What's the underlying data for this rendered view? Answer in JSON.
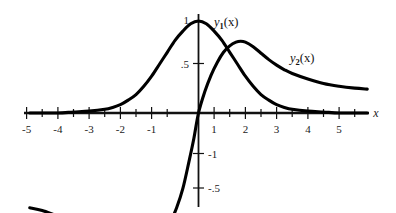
{
  "figure": {
    "background_color": "#ffffff",
    "curve_color": "#000000",
    "axis_color": "#111111"
  },
  "axes": {
    "x_axis_name": "x",
    "x_label_prefix": "y",
    "x_ticks_major": [
      -5,
      -4,
      -3,
      -2,
      -1,
      1,
      2,
      3,
      4,
      5
    ],
    "x_tick_labels": [
      "-5",
      "-4",
      "-3",
      "-2",
      "-1",
      "1",
      "2",
      "3",
      "4",
      "5"
    ],
    "x_ticks_minor_step": 0.5,
    "x_range": [
      -5.45,
      5.45
    ],
    "y_range": [
      -1.62,
      1.18
    ],
    "y_tick_values": [
      1,
      0.5,
      -1,
      -1.5
    ],
    "y_tick_labels": [
      "1",
      ".5",
      "-1",
      "-.5"
    ],
    "grid": false
  },
  "labels": {
    "y1": {
      "base": "y",
      "sub": "1",
      "arg": "(x)"
    },
    "y2": {
      "base": "y",
      "sub": "2",
      "arg": "(x)"
    }
  },
  "chart_data": {
    "type": "line",
    "xlabel": "x",
    "ylabel": "",
    "xlim": [
      -5.45,
      5.45
    ],
    "ylim": [
      -1.62,
      1.18
    ],
    "grid": false,
    "legend_position": "inline-annotation",
    "x_ticks": [
      -5,
      -4,
      -3,
      -2,
      -1,
      0,
      1,
      2,
      3,
      4,
      5
    ],
    "y_ticks": [
      1,
      0.5,
      -1,
      -1.5
    ],
    "y_tick_labels": [
      "1",
      ".5",
      "-1",
      "-.5"
    ],
    "series": [
      {
        "name": "y1(x)",
        "description": "Bell-shaped curve peaking at x=0 with maximum value 1, decaying to 0 on both sides",
        "x": [
          -5.4,
          -5.0,
          -4.5,
          -4.0,
          -3.5,
          -3.0,
          -2.75,
          -2.5,
          -2.25,
          -2.0,
          -1.75,
          -1.5,
          -1.25,
          -1.0,
          -0.75,
          -0.5,
          -0.25,
          0.0,
          0.25,
          0.5,
          0.75,
          1.0,
          1.25,
          1.5,
          1.75,
          2.0,
          2.25,
          2.5,
          2.75,
          3.0,
          3.5,
          4.0,
          4.5,
          5.0,
          5.4
        ],
        "y": [
          0.0,
          0.0,
          0.0,
          0.01,
          0.02,
          0.04,
          0.06,
          0.09,
          0.14,
          0.2,
          0.29,
          0.4,
          0.53,
          0.66,
          0.79,
          0.89,
          0.97,
          1.0,
          0.97,
          0.89,
          0.79,
          0.66,
          0.53,
          0.4,
          0.29,
          0.2,
          0.14,
          0.09,
          0.06,
          0.04,
          0.02,
          0.01,
          0.0,
          0.0,
          0.0
        ]
      },
      {
        "name": "y2(x)",
        "description": "Odd-like curve through origin, minimum about -1.33 near x=-1.3, maximum about 0.78 near x=1.35, long positive tail at right and flat negative tail at left",
        "x": [
          -5.4,
          -5.0,
          -4.5,
          -4.0,
          -3.5,
          -3.0,
          -2.5,
          -2.0,
          -1.75,
          -1.5,
          -1.3,
          -1.1,
          -0.9,
          -0.7,
          -0.5,
          -0.3,
          -0.15,
          0.0,
          0.2,
          0.4,
          0.6,
          0.8,
          1.0,
          1.2,
          1.35,
          1.5,
          1.75,
          2.0,
          2.25,
          2.5,
          2.75,
          3.0,
          3.5,
          4.0,
          4.5,
          5.0,
          5.4
        ],
        "y": [
          -1.03,
          -1.06,
          -1.12,
          -1.17,
          -1.22,
          -1.27,
          -1.32,
          -1.33,
          -1.33,
          -1.33,
          -1.32,
          -1.27,
          -1.18,
          -1.03,
          -0.82,
          -0.52,
          -0.28,
          0.0,
          0.23,
          0.41,
          0.55,
          0.66,
          0.73,
          0.77,
          0.78,
          0.77,
          0.72,
          0.65,
          0.58,
          0.52,
          0.47,
          0.43,
          0.37,
          0.32,
          0.29,
          0.27,
          0.26
        ]
      }
    ],
    "annotations": [
      {
        "text": "y1(x)",
        "x": 0.55,
        "y": 1.08
      },
      {
        "text": "y2(x)",
        "x": 3.0,
        "y": 0.62
      }
    ]
  }
}
